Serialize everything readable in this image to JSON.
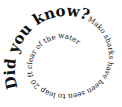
{
  "spiral": {
    "headline": "Did you know?",
    "body": "Mako sharks have been seen to leap 20 ft clear of the water",
    "text_color": "#111111",
    "background": "#ffffff"
  }
}
